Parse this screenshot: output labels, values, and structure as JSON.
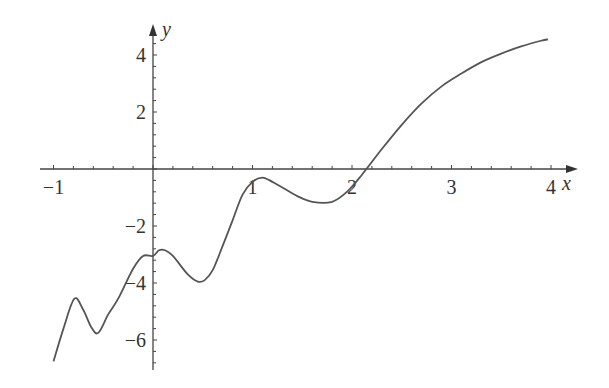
{
  "chart_data": {
    "type": "line",
    "title": "",
    "xlabel": "x",
    "ylabel": "y",
    "xlim": [
      -1,
      4.2
    ],
    "ylim": [
      -7,
      4.8
    ],
    "grid": false,
    "legend": null,
    "x_ticks": [
      -1,
      1,
      2,
      3,
      4
    ],
    "x_tick_labels": [
      "−1",
      "1",
      "2",
      "3",
      "4"
    ],
    "y_ticks": [
      4,
      2,
      -2,
      -4,
      -6
    ],
    "y_tick_labels": [
      "4",
      "2",
      "−2",
      "−4",
      "−6"
    ],
    "series": [
      {
        "name": "f(x)",
        "color": "#555555",
        "x": [
          -1.0,
          -0.9,
          -0.79,
          -0.7,
          -0.62,
          -0.55,
          -0.45,
          -0.35,
          -0.2,
          -0.1,
          0.0,
          0.06,
          0.12,
          0.2,
          0.35,
          0.45,
          0.52,
          0.6,
          0.7,
          0.8,
          0.9,
          1.0,
          1.1,
          1.2,
          1.3,
          1.45,
          1.6,
          1.8,
          1.95,
          2.1,
          2.3,
          2.5,
          2.7,
          2.9,
          3.1,
          3.3,
          3.5,
          3.7,
          3.9,
          3.97
        ],
        "y": [
          -6.75,
          -5.6,
          -4.55,
          -4.95,
          -5.55,
          -5.75,
          -5.1,
          -4.55,
          -3.5,
          -3.05,
          -3.05,
          -2.85,
          -2.85,
          -3.05,
          -3.7,
          -3.95,
          -3.9,
          -3.55,
          -2.7,
          -1.8,
          -0.9,
          -0.45,
          -0.3,
          -0.45,
          -0.65,
          -0.95,
          -1.15,
          -1.15,
          -0.8,
          -0.2,
          0.7,
          1.55,
          2.3,
          2.9,
          3.35,
          3.75,
          4.05,
          4.3,
          4.5,
          4.55
        ]
      }
    ]
  },
  "axes": {
    "x_label": "x",
    "y_label": "y"
  }
}
